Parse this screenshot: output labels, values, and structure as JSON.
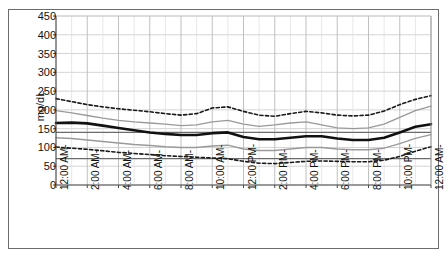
{
  "chart_data": {
    "type": "line",
    "title": "",
    "subtitle": "",
    "xlabel": "",
    "ylabel": "mg/dL",
    "ylim": [
      0,
      450
    ],
    "ytick_values": [
      0,
      50,
      100,
      150,
      200,
      250,
      300,
      350,
      400,
      450
    ],
    "ytick_labels": [
      "0",
      "50",
      "100",
      "150",
      "200",
      "250",
      "300",
      "350",
      "400",
      "450"
    ],
    "grid": true,
    "legend": "none",
    "x": [
      "12:00 AM",
      "1:00 AM",
      "2:00 AM",
      "3:00 AM",
      "4:00 AM",
      "5:00 AM",
      "6:00 AM",
      "7:00 AM",
      "8:00 AM",
      "9:00 AM",
      "10:00 AM",
      "11:00 AM",
      "12:00 PM",
      "1:00 PM",
      "2:00 PM",
      "3:00 PM",
      "4:00 PM",
      "5:00 PM",
      "6:00 PM",
      "7:00 PM",
      "8:00 PM",
      "9:00 PM",
      "10:00 PM",
      "11:00 PM",
      "12:00 AM"
    ],
    "xtick_labels": [
      "12:00 AM-",
      "2:00 AM-",
      "4:00 AM-",
      "6:00 AM-",
      "8:00 AM-",
      "10:00 AM-",
      "12:00 PM-",
      "2:00 PM-",
      "4:00 PM-",
      "6:00 PM-",
      "8:00 PM-",
      "10:00 PM-",
      "12:00 AM-"
    ],
    "xlim": [
      0,
      24
    ],
    "series": [
      {
        "name": "95th percentile",
        "style": "dashed",
        "color": "#1a1a1a",
        "width": 1.6,
        "values": [
          230,
          222,
          214,
          208,
          203,
          199,
          195,
          190,
          186,
          190,
          205,
          208,
          196,
          186,
          183,
          190,
          196,
          192,
          186,
          184,
          186,
          197,
          214,
          228,
          238
        ]
      },
      {
        "name": "75th percentile",
        "style": "solid",
        "color": "#9a9a9a",
        "width": 1.4,
        "values": [
          198,
          192,
          185,
          178,
          172,
          168,
          165,
          162,
          158,
          160,
          168,
          172,
          162,
          156,
          160,
          165,
          168,
          160,
          152,
          150,
          152,
          162,
          180,
          198,
          210
        ]
      },
      {
        "name": "Median",
        "style": "solid",
        "color": "#111111",
        "width": 2.6,
        "values": [
          165,
          166,
          164,
          158,
          152,
          146,
          140,
          136,
          133,
          133,
          138,
          140,
          128,
          122,
          122,
          126,
          130,
          130,
          124,
          120,
          120,
          126,
          140,
          155,
          162
        ]
      },
      {
        "name": "25th percentile",
        "style": "solid",
        "color": "#9a9a9a",
        "width": 1.4,
        "values": [
          126,
          124,
          120,
          116,
          112,
          108,
          105,
          102,
          100,
          100,
          104,
          106,
          96,
          92,
          92,
          96,
          100,
          100,
          96,
          94,
          94,
          98,
          110,
          124,
          134
        ]
      },
      {
        "name": "5th percentile",
        "style": "dashed",
        "color": "#1a1a1a",
        "width": 1.6,
        "values": [
          101,
          98,
          95,
          91,
          87,
          84,
          81,
          78,
          76,
          74,
          72,
          70,
          63,
          58,
          57,
          60,
          63,
          64,
          63,
          62,
          62,
          66,
          76,
          90,
          102
        ]
      }
    ],
    "reference_lines": [
      {
        "name": "upper-target",
        "value": 140,
        "color": "#6b6b6b"
      },
      {
        "name": "lower-target",
        "value": 70,
        "color": "#6b6b6b"
      }
    ]
  }
}
